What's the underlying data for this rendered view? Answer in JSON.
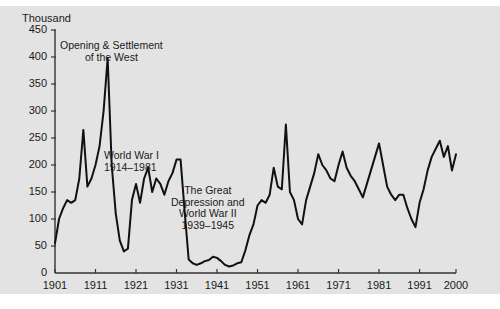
{
  "chart_data": {
    "type": "line",
    "title": "",
    "xlabel": "",
    "ylabel": "Thousand",
    "unit_label": "Thousand",
    "xlim": [
      1901,
      2000
    ],
    "ylim": [
      0,
      450
    ],
    "grid": false,
    "legend": "none",
    "yticks": [
      0,
      50,
      100,
      150,
      200,
      250,
      300,
      350,
      400,
      450
    ],
    "ytick_labels": [
      "0",
      "50",
      "100",
      "150",
      "200",
      "250",
      "300",
      "350",
      "400",
      "450"
    ],
    "xticks": [
      1901,
      1911,
      1921,
      1931,
      1941,
      1951,
      1961,
      1971,
      1981,
      1991,
      2000
    ],
    "xtick_labels": [
      "1901",
      "1911",
      "1921",
      "1931",
      "1941",
      "1951",
      "1961",
      "1971",
      "1981",
      "1991",
      "2000"
    ],
    "line_color": "#111111",
    "line_width": 2,
    "background_color": "#e3e3e3",
    "series": [
      {
        "name": "Immigration to the United States",
        "x": [
          1901,
          1902,
          1903,
          1904,
          1905,
          1906,
          1907,
          1908,
          1909,
          1910,
          1911,
          1912,
          1913,
          1914,
          1915,
          1916,
          1917,
          1918,
          1919,
          1920,
          1921,
          1922,
          1923,
          1924,
          1925,
          1926,
          1927,
          1928,
          1929,
          1930,
          1931,
          1932,
          1933,
          1934,
          1935,
          1936,
          1937,
          1938,
          1939,
          1940,
          1941,
          1942,
          1943,
          1944,
          1945,
          1946,
          1947,
          1948,
          1949,
          1950,
          1951,
          1952,
          1953,
          1954,
          1955,
          1956,
          1957,
          1958,
          1959,
          1960,
          1961,
          1962,
          1963,
          1964,
          1965,
          1966,
          1967,
          1968,
          1969,
          1970,
          1971,
          1972,
          1973,
          1974,
          1975,
          1976,
          1977,
          1978,
          1979,
          1980,
          1981,
          1982,
          1983,
          1984,
          1985,
          1986,
          1987,
          1988,
          1989,
          1990,
          1991,
          1992,
          1993,
          1994,
          1995,
          1996,
          1997,
          1998,
          1999,
          2000
        ],
        "values": [
          55,
          100,
          120,
          135,
          130,
          135,
          175,
          265,
          160,
          175,
          200,
          235,
          300,
          398,
          200,
          110,
          60,
          40,
          45,
          135,
          165,
          130,
          175,
          195,
          150,
          175,
          165,
          145,
          170,
          185,
          210,
          210,
          115,
          25,
          18,
          15,
          18,
          22,
          24,
          30,
          28,
          22,
          15,
          12,
          14,
          18,
          20,
          42,
          70,
          90,
          125,
          135,
          130,
          145,
          195,
          160,
          155,
          275,
          150,
          135,
          100,
          90,
          135,
          160,
          185,
          220,
          200,
          190,
          175,
          170,
          200,
          225,
          195,
          180,
          170,
          155,
          140,
          165,
          190,
          215,
          240,
          200,
          160,
          145,
          135,
          145,
          145,
          120,
          100,
          85,
          130,
          155,
          190,
          215,
          230,
          245,
          215,
          235,
          190,
          220
        ]
      }
    ],
    "annotations": [
      {
        "id": "opening-west",
        "lines": [
          "Opening & Settlement",
          "of the West"
        ],
        "align": "center",
        "x": 60,
        "y": 40
      },
      {
        "id": "world-war-one",
        "lines": [
          "World War I",
          "1914–1981"
        ],
        "align": "left",
        "x": 104,
        "y": 150
      },
      {
        "id": "great-depression-wwii",
        "lines": [
          "The Great",
          "Depression and",
          "World War II",
          "1939–1945"
        ],
        "align": "center",
        "x": 171,
        "y": 185
      }
    ]
  }
}
